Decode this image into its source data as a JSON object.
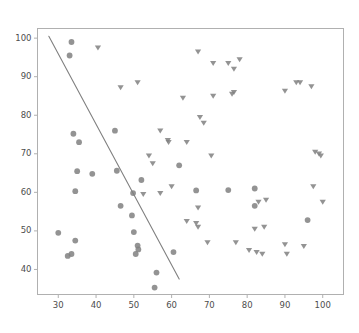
{
  "chart_data": {
    "type": "scatter",
    "title": "",
    "xlabel": "",
    "ylabel": "",
    "xlim": [
      24.5,
      105.5
    ],
    "ylim": [
      33.5,
      102.5
    ],
    "xticks": [
      30,
      40,
      50,
      60,
      70,
      80,
      90,
      100
    ],
    "yticks": [
      40,
      50,
      60,
      70,
      80,
      90,
      100
    ],
    "grid": false,
    "legend": "none",
    "marker_color": "#808080",
    "line_color": "#808080",
    "axes_color": "#b0b0b0",
    "tick_label_color": "#4d4d4d",
    "series": [
      {
        "name": "circles",
        "marker": "circle",
        "color": "#808080",
        "points": [
          [
            33.5,
            99.0
          ],
          [
            33.0,
            95.5
          ],
          [
            34.0,
            75.2
          ],
          [
            35.5,
            73.0
          ],
          [
            45.0,
            76.0
          ],
          [
            45.5,
            65.6
          ],
          [
            35.0,
            65.5
          ],
          [
            39.0,
            64.8
          ],
          [
            34.5,
            60.3
          ],
          [
            46.5,
            56.5
          ],
          [
            30.0,
            49.5
          ],
          [
            34.5,
            47.5
          ],
          [
            32.5,
            43.5
          ],
          [
            33.5,
            44.0
          ],
          [
            49.5,
            54.0
          ],
          [
            50.0,
            49.7
          ],
          [
            51.0,
            46.2
          ],
          [
            51.2,
            45.2
          ],
          [
            52.0,
            63.2
          ],
          [
            49.8,
            59.8
          ],
          [
            50.5,
            44.0
          ],
          [
            56.0,
            39.2
          ],
          [
            55.5,
            35.3
          ],
          [
            60.5,
            44.5
          ],
          [
            62.0,
            67.0
          ],
          [
            66.5,
            60.5
          ],
          [
            75.0,
            60.6
          ],
          [
            82.0,
            61.0
          ],
          [
            82.0,
            56.5
          ],
          [
            96.0,
            52.8
          ]
        ]
      },
      {
        "name": "triangles",
        "marker": "triangle-down",
        "color": "#808080",
        "points": [
          [
            40.5,
            97.5
          ],
          [
            67.0,
            96.5
          ],
          [
            78.0,
            94.5
          ],
          [
            71.0,
            93.5
          ],
          [
            75.0,
            93.5
          ],
          [
            76.5,
            92.0
          ],
          [
            93.0,
            88.5
          ],
          [
            94.0,
            88.5
          ],
          [
            97.0,
            87.5
          ],
          [
            46.5,
            87.2
          ],
          [
            51.0,
            88.5
          ],
          [
            90.0,
            86.3
          ],
          [
            63.0,
            84.5
          ],
          [
            71.0,
            85.0
          ],
          [
            76.0,
            85.5
          ],
          [
            76.5,
            86.0
          ],
          [
            67.5,
            79.5
          ],
          [
            68.5,
            78.0
          ],
          [
            57.0,
            76.0
          ],
          [
            59.0,
            73.5
          ],
          [
            59.2,
            73.0
          ],
          [
            64.0,
            73.0
          ],
          [
            70.5,
            69.5
          ],
          [
            98.0,
            70.5
          ],
          [
            99.0,
            70.0
          ],
          [
            99.5,
            69.5
          ],
          [
            97.5,
            61.5
          ],
          [
            54.0,
            69.5
          ],
          [
            55.0,
            67.5
          ],
          [
            52.5,
            59.5
          ],
          [
            57.0,
            59.8
          ],
          [
            60.0,
            61.5
          ],
          [
            64.0,
            52.5
          ],
          [
            66.5,
            52.0
          ],
          [
            67.0,
            51.0
          ],
          [
            69.5,
            47.0
          ],
          [
            82.0,
            50.5
          ],
          [
            84.5,
            51.0
          ],
          [
            77.0,
            47.0
          ],
          [
            80.5,
            45.0
          ],
          [
            82.5,
            44.5
          ],
          [
            84.0,
            44.0
          ],
          [
            90.0,
            46.5
          ],
          [
            90.5,
            44.0
          ],
          [
            95.0,
            46.0
          ],
          [
            83.0,
            57.5
          ],
          [
            85.0,
            58.0
          ],
          [
            100.0,
            57.5
          ],
          [
            67.0,
            56.0
          ]
        ]
      }
    ],
    "trendline": {
      "name": "fit-line",
      "color": "#808080",
      "x0": 27.5,
      "y0": 100.5,
      "x1": 62.0,
      "y1": 37.5
    }
  }
}
